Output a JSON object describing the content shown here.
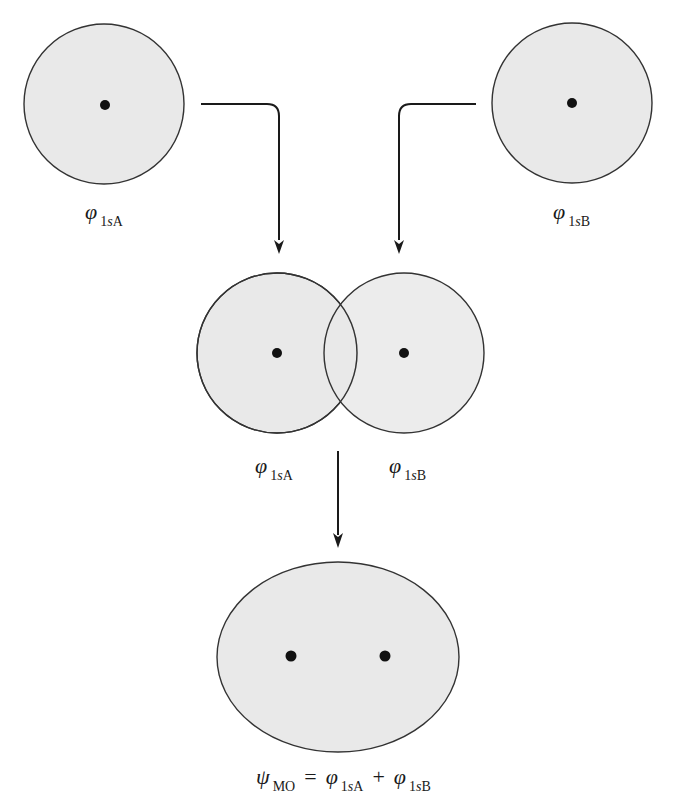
{
  "colors": {
    "orbital_fill": "#e9e9e9",
    "orbital_stroke": "#333333",
    "nucleus": "#111111",
    "arrow": "#1a1a1a"
  },
  "orbitals": {
    "atom_a": {
      "symbol": "φ",
      "sub_prefix": "1",
      "sub_italic": "s",
      "sub_suffix": "A"
    },
    "atom_b": {
      "symbol": "φ",
      "sub_prefix": "1",
      "sub_italic": "s",
      "sub_suffix": "B"
    },
    "overlap_a": {
      "symbol": "φ",
      "sub_prefix": "1",
      "sub_italic": "s",
      "sub_suffix": "A"
    },
    "overlap_b": {
      "symbol": "φ",
      "sub_prefix": "1",
      "sub_italic": "s",
      "sub_suffix": "B"
    }
  },
  "equation": {
    "lhs_symbol": "ψ",
    "lhs_sub": "MO",
    "equals": "=",
    "term1_symbol": "φ",
    "term1_sub_prefix": "1",
    "term1_sub_italic": "s",
    "term1_sub_suffix": "A",
    "plus": "+",
    "term2_symbol": "φ",
    "term2_sub_prefix": "1",
    "term2_sub_italic": "s",
    "term2_sub_suffix": "B"
  }
}
